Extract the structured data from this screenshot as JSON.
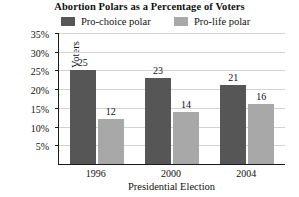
{
  "chart_data": {
    "type": "bar",
    "title": "Abortion Polars as a Percentage of Voters",
    "xlabel": "Presidential Election",
    "ylabel": "Percentage of Voters",
    "categories": [
      "1996",
      "2000",
      "2004"
    ],
    "series": [
      {
        "name": "Pro-choice polar",
        "color": "#565656",
        "values": [
          25,
          23,
          21
        ]
      },
      {
        "name": "Pro-life polar",
        "color": "#a8a8a8",
        "values": [
          12,
          14,
          16
        ]
      }
    ],
    "ylim": [
      0,
      35
    ],
    "yticks": [
      "5%",
      "10%",
      "15%",
      "20%",
      "25%",
      "30%",
      "35%"
    ],
    "ytick_values": [
      5,
      10,
      15,
      20,
      25,
      30,
      35
    ],
    "grid": true,
    "legend_position": "top",
    "value_labels": [
      [
        "25",
        "23",
        "21"
      ],
      [
        "12",
        "14",
        "16"
      ]
    ]
  },
  "colors": {
    "series_dark": "#565656",
    "series_light": "#a8a8a8",
    "axis": "#1a1a1a",
    "grid": "#d2d2d2",
    "background": "#ffffff"
  }
}
